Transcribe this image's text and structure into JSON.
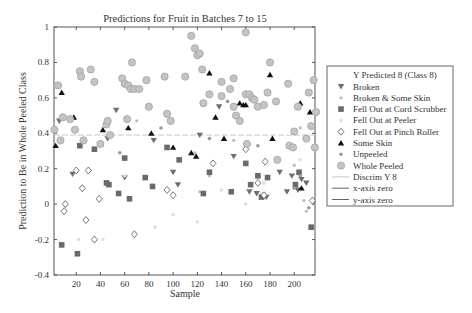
{
  "chart_data": {
    "type": "scatter",
    "title": "Predictions for Fruit in Batches 7 to 15",
    "xlabel": "Sample",
    "ylabel": "Prediction to Be in Whole Peeled Class",
    "xlim": [
      0,
      217
    ],
    "ylim": [
      -0.4,
      1
    ],
    "xticks": [
      20,
      40,
      60,
      80,
      100,
      120,
      140,
      160,
      180,
      200
    ],
    "yticks": [
      -0.4,
      -0.2,
      0,
      0.2,
      0.4,
      0.6,
      0.8,
      1
    ],
    "ytick_labels": [
      "-0.4",
      "-0.2",
      "0",
      "0.2",
      "0.4",
      "0.6",
      "0.8",
      "1"
    ],
    "grid": false,
    "legend_position": "right-outside",
    "legend_title": "Y Predicted 8 (Class 8)",
    "discrim_y": 0.39,
    "series": [
      {
        "name": "Broken",
        "marker": "triangle-down",
        "color": "#6e6e6e",
        "points": [
          [
            6,
            0.47
          ],
          [
            17,
            0.17
          ],
          [
            46,
            0.37
          ],
          [
            53,
            0.53
          ],
          [
            60,
            0.15
          ],
          [
            84,
            0.36
          ],
          [
            100,
            0.18
          ],
          [
            104,
            0.11
          ],
          [
            122,
            0.39
          ],
          [
            138,
            0.55
          ],
          [
            150,
            0.27
          ],
          [
            163,
            0.07
          ],
          [
            169,
            0.06
          ],
          [
            177,
            0.04
          ],
          [
            188,
            0.18
          ],
          [
            194,
            0.07
          ],
          [
            198,
            0.16
          ],
          [
            203,
            0.08
          ],
          [
            210,
            0.12
          ],
          [
            206,
            0.14
          ]
        ]
      },
      {
        "name": "Broken & Some Skin",
        "marker": "dot-small",
        "color": "#bdbdbd",
        "points": [
          [
            70,
            0.47
          ],
          [
            118,
            0.29
          ],
          [
            122,
            0.07
          ],
          [
            130,
            0.16
          ],
          [
            150,
            0.36
          ],
          [
            175,
            0.06
          ],
          [
            205,
            0.43
          ],
          [
            208,
            0.02
          ],
          [
            210,
            -0.04
          ],
          [
            200,
            0.22
          ]
        ]
      },
      {
        "name": "Fell Out at Cord Scrubber",
        "marker": "square",
        "color": "#6a6a6a",
        "points": [
          [
            8,
            -0.23
          ],
          [
            21,
            -0.28
          ],
          [
            23,
            0.33
          ],
          [
            35,
            0.31
          ],
          [
            45,
            0.12
          ],
          [
            47,
            0.11
          ],
          [
            55,
            0.06
          ],
          [
            60,
            0.26
          ],
          [
            64,
            0.03
          ],
          [
            77,
            0.15
          ],
          [
            83,
            0.1
          ],
          [
            95,
            0.32
          ],
          [
            105,
            0.25
          ],
          [
            125,
            0.06
          ],
          [
            130,
            0.18
          ],
          [
            148,
            0.07
          ],
          [
            160,
            0.23
          ],
          [
            164,
            0.11
          ],
          [
            170,
            0.16
          ],
          [
            173,
            0.04
          ],
          [
            178,
            0.15
          ],
          [
            201,
            0.11
          ],
          [
            204,
            0.18
          ],
          [
            214,
            -0.13
          ]
        ]
      },
      {
        "name": "Fell Out at Peeler",
        "marker": "dot-faint",
        "color": "#e0e0e0",
        "points": [
          [
            22,
            -0.2
          ],
          [
            42,
            -0.2
          ],
          [
            60,
            0.16
          ],
          [
            85,
            -0.13
          ],
          [
            100,
            -0.06
          ],
          [
            120,
            -0.1
          ],
          [
            140,
            0.08
          ],
          [
            160,
            0.0
          ],
          [
            175,
            0.12
          ],
          [
            205,
            0.25
          ]
        ]
      },
      {
        "name": "Fell Out at Pinch Roller",
        "marker": "diamond-open",
        "color": "#555555",
        "points": [
          [
            10,
            -0.04
          ],
          [
            11,
            0.0
          ],
          [
            20,
            0.19
          ],
          [
            28,
            -0.09
          ],
          [
            30,
            0.19
          ],
          [
            25,
            0.09
          ],
          [
            35,
            -0.2
          ],
          [
            39,
            0.03
          ],
          [
            68,
            -0.17
          ],
          [
            95,
            0.08
          ],
          [
            100,
            0.05
          ],
          [
            133,
            0.23
          ],
          [
            160,
            0.31
          ],
          [
            170,
            0.12
          ],
          [
            175,
            0.05
          ],
          [
            176,
            0.24
          ],
          [
            215,
            0.02
          ]
        ]
      },
      {
        "name": "Some Skin",
        "marker": "triangle-up",
        "color": "#111111",
        "points": [
          [
            3,
            0.33
          ],
          [
            8,
            0.63
          ],
          [
            18,
            0.49
          ],
          [
            42,
            0.42
          ],
          [
            63,
            0.43
          ],
          [
            82,
            0.4
          ],
          [
            100,
            0.32
          ],
          [
            115,
            0.29
          ],
          [
            119,
            0.27
          ],
          [
            130,
            0.74
          ],
          [
            135,
            0.49
          ],
          [
            142,
            0.37
          ],
          [
            155,
            0.57
          ],
          [
            158,
            0.56
          ],
          [
            160,
            0.56
          ],
          [
            180,
            0.73
          ],
          [
            182,
            0.37
          ],
          [
            205,
            0.57
          ],
          [
            206,
            0.09
          ],
          [
            213,
            0.52
          ]
        ]
      },
      {
        "name": "Unpeeled",
        "marker": "dot-mid",
        "color": "#9a9a9a",
        "points": [
          [
            56,
            0.29
          ],
          [
            90,
            0.43
          ],
          [
            130,
            0.37
          ],
          [
            145,
            0.58
          ],
          [
            170,
            0.33
          ],
          [
            200,
            0.09
          ],
          [
            205,
            0.16
          ],
          [
            212,
            -0.02
          ]
        ]
      },
      {
        "name": "Whole Peeled",
        "marker": "circle",
        "color": "#a8a8a8",
        "points": [
          [
            2,
            0.42
          ],
          [
            5,
            0.67
          ],
          [
            9,
            0.49
          ],
          [
            15,
            0.48
          ],
          [
            19,
            0.42
          ],
          [
            7,
            0.36
          ],
          [
            23,
            0.75
          ],
          [
            24,
            0.72
          ],
          [
            26,
            0.36
          ],
          [
            32,
            0.76
          ],
          [
            35,
            0.69
          ],
          [
            40,
            0.34
          ],
          [
            45,
            0.45
          ],
          [
            46,
            0.47
          ],
          [
            48,
            0.39
          ],
          [
            58,
            0.71
          ],
          [
            60,
            0.68
          ],
          [
            63,
            0.67
          ],
          [
            65,
            0.65
          ],
          [
            68,
            0.65
          ],
          [
            62,
            0.48
          ],
          [
            66,
            0.8
          ],
          [
            72,
            0.65
          ],
          [
            78,
            0.7
          ],
          [
            80,
            0.55
          ],
          [
            93,
            0.72
          ],
          [
            95,
            0.51
          ],
          [
            98,
            0.47
          ],
          [
            110,
            0.72
          ],
          [
            115,
            0.95
          ],
          [
            118,
            0.88
          ],
          [
            120,
            0.84
          ],
          [
            122,
            0.85
          ],
          [
            124,
            0.76
          ],
          [
            125,
            0.57
          ],
          [
            140,
            0.69
          ],
          [
            147,
            0.65
          ],
          [
            150,
            0.55
          ],
          [
            152,
            0.5
          ],
          [
            155,
            0.47
          ],
          [
            160,
            0.62
          ],
          [
            163,
            0.62
          ],
          [
            165,
            0.6
          ],
          [
            167,
            0.59
          ],
          [
            170,
            0.55
          ],
          [
            175,
            0.56
          ],
          [
            178,
            0.63
          ],
          [
            185,
            0.58
          ],
          [
            195,
            0.68
          ],
          [
            200,
            0.41
          ],
          [
            203,
            0.55
          ],
          [
            210,
            0.37
          ],
          [
            212,
            0.63
          ],
          [
            214,
            0.44
          ],
          [
            216,
            0.7
          ],
          [
            217,
            0.32
          ],
          [
            218,
            0.52
          ],
          [
            196,
            0.33
          ],
          [
            199,
            0.32
          ],
          [
            180,
            0.8
          ],
          [
            130,
            0.62
          ],
          [
            140,
            0.61
          ],
          [
            150,
            0.71
          ],
          [
            161,
            0.34
          ],
          [
            160,
            0.97
          ],
          [
            186,
            0.25
          ]
        ]
      }
    ],
    "reference_lines": [
      {
        "name": "Discrim Y 8",
        "style": "dashed-light",
        "orientation": "horizontal",
        "value": 0.39
      },
      {
        "name": "x-axis zero",
        "style": "solid",
        "orientation": "horizontal",
        "value": 0
      },
      {
        "name": "y-axis zero",
        "style": "solid",
        "orientation": "vertical",
        "value": 0
      }
    ]
  },
  "legend": {
    "title": "Y Predicted 8 (Class 8)",
    "items": [
      {
        "label": "Broken",
        "marker": "triangle-down"
      },
      {
        "label": "Broken & Some Skin",
        "marker": "dot-small"
      },
      {
        "label": "Fell Out at Cord Scrubber",
        "marker": "square"
      },
      {
        "label": "Fell Out at Peeler",
        "marker": "dot-faint"
      },
      {
        "label": "Fell Out at Pinch Roller",
        "marker": "diamond-open"
      },
      {
        "label": "Some Skin",
        "marker": "triangle-up"
      },
      {
        "label": "Unpeeled",
        "marker": "dot-mid"
      },
      {
        "label": "Whole Peeled",
        "marker": "circle"
      },
      {
        "label": "Discrim Y 8",
        "marker": "line-light"
      },
      {
        "label": "x-axis zero",
        "marker": "line"
      },
      {
        "label": "y-axis zero",
        "marker": "line"
      }
    ]
  }
}
